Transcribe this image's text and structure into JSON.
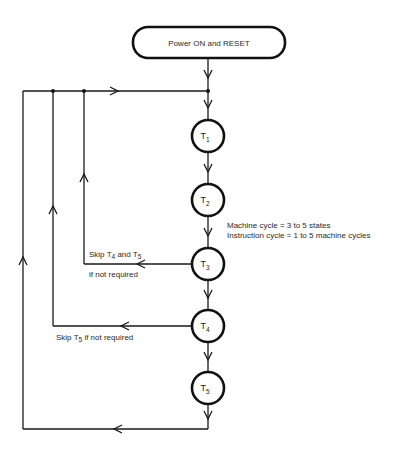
{
  "diagram": {
    "type": "state-flowchart",
    "start_node": {
      "label": "Power ON and RESET"
    },
    "states": [
      {
        "id": "T1",
        "base": "T",
        "sub": "1"
      },
      {
        "id": "T2",
        "base": "T",
        "sub": "2"
      },
      {
        "id": "T3",
        "base": "T",
        "sub": "3"
      },
      {
        "id": "T4",
        "base": "T",
        "sub": "4"
      },
      {
        "id": "T5",
        "base": "T",
        "sub": "5"
      }
    ],
    "notes": {
      "machine_cycle": "Machine cycle = 3 to 5 states",
      "instruction_cycle": "Instruction cycle = 1 to 5 machine cycles"
    },
    "branches": {
      "skip_t4_t5": {
        "prefix": "Skip T",
        "sub1": "4",
        "mid": " and T",
        "sub2": "5",
        "line2": "if not required"
      },
      "skip_t5": {
        "prefix": "Skip T",
        "sub1": "5",
        "suffix": " if not required"
      }
    },
    "colors": {
      "line": "#1a1a1a",
      "background": "#ffffff"
    }
  }
}
